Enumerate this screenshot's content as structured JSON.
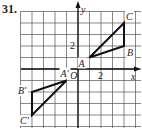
{
  "problem_number": "31.",
  "grid": {
    "origin_px": [
      78,
      69
    ],
    "cell_px": 11.5,
    "x_range": [
      -5,
      5
    ],
    "y_range": [
      -5,
      5
    ],
    "line_color": "#555555",
    "axis_color": "#111111",
    "shape_color": "#111111"
  },
  "axes": {
    "x_label": "x",
    "y_label": "y",
    "origin_label": "O",
    "x_tick_label": "2",
    "y_tick_label": "2"
  },
  "triangles": [
    {
      "name": "ABC",
      "vertices": [
        {
          "label": "A",
          "x": 1,
          "y": 1
        },
        {
          "label": "B",
          "x": 4,
          "y": 2
        },
        {
          "label": "C",
          "x": 4,
          "y": 4
        }
      ]
    },
    {
      "name": "A'B'C'",
      "vertices": [
        {
          "label": "A′",
          "x": -1,
          "y": -1
        },
        {
          "label": "B′",
          "x": -4,
          "y": -2
        },
        {
          "label": "C′",
          "x": -4,
          "y": -4
        }
      ]
    }
  ]
}
